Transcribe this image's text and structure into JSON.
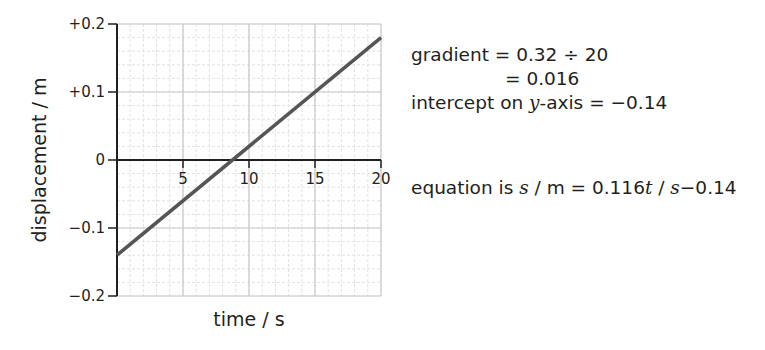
{
  "chart_data": {
    "type": "line",
    "title": "",
    "xlabel": "time / s",
    "ylabel": "displacement / m",
    "xlim": [
      0,
      20
    ],
    "ylim": [
      -0.2,
      0.2
    ],
    "x_ticks": [
      5,
      10,
      15,
      20
    ],
    "x_tick_labels": [
      "5",
      "10",
      "15",
      "20"
    ],
    "y_ticks": [
      0.2,
      0.1,
      0,
      -0.1,
      -0.2
    ],
    "y_tick_labels": [
      "+0.2",
      "+0.1",
      "0",
      "−0.1",
      "−0.2"
    ],
    "grid": true,
    "grid_major": {
      "x_step": 5,
      "y_step": 0.1
    },
    "grid_minor": {
      "x_step": 1,
      "y_step": 0.02
    },
    "legend": null,
    "series": [
      {
        "name": "displacement",
        "x": [
          0,
          20
        ],
        "y": [
          -0.14,
          0.18
        ],
        "color": "#555555"
      }
    ]
  },
  "annotations": {
    "gradient_line1_a": "gradient = 0.32 ÷ 20",
    "gradient_line2": "= 0.016",
    "intercept_prefix": "intercept on ",
    "intercept_var": "y",
    "intercept_suffix": "-axis = −0.14",
    "equation_prefix": "equation is ",
    "equation_s": "s",
    "equation_mid": " / m = 0.116",
    "equation_t": "t",
    "equation_slash": " / ",
    "equation_s2": "s",
    "equation_end": "−0.14"
  },
  "colors": {
    "line": "#555555",
    "axis": "#231f20",
    "grid_major": "#c8c8c8",
    "grid_minor": "#e2e2e2"
  }
}
